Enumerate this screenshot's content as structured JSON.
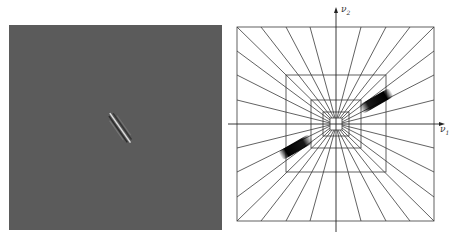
{
  "figure": {
    "left_panel": {
      "description": "spatial-domain image: gray field with a single oriented Gabor-like feature",
      "background_color": "#5b5b5b",
      "feature_orientation": "diagonal, top-left to bottom-right"
    },
    "right_panel": {
      "description": "frequency-domain tiling: nested squares with radial wedges; two dark blobs along a diagonal",
      "axis_x_label": "ν",
      "axis_x_sub": "1",
      "axis_y_label": "ν",
      "axis_y_sub": "2",
      "line_color": "#333333",
      "blob_color": "#000000"
    }
  }
}
